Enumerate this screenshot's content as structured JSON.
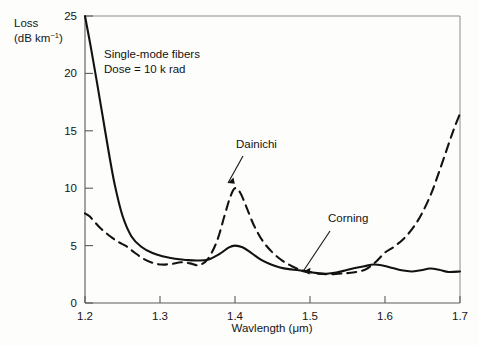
{
  "figure": {
    "background_color": "#fdfdfb",
    "ink_color": "#121212"
  },
  "axes": {
    "y_label_line1": "Loss",
    "y_label_line2_prefix": "(dB km",
    "y_label_line2_sup": "−1",
    "y_label_line2_suffix": ")",
    "x_label": "Wavlength (μm)",
    "y_ticks": [
      "0",
      "5",
      "10",
      "15",
      "20",
      "25"
    ],
    "x_ticks": [
      "1.2",
      "1.3",
      "1.4",
      "1.5",
      "1.6",
      "1.7"
    ]
  },
  "annotations": {
    "note_line1": "Single-mode fibers",
    "note_line2": "Dose = 10 k rad",
    "dainichi_label": "Dainichi",
    "corning_label": "Corning"
  },
  "chart_data": {
    "type": "line",
    "title": "",
    "subtitle": "Single-mode fibers, Dose = 10 k rad",
    "xlabel": "Wavlength (μm)",
    "ylabel": "Loss (dB km−1)",
    "xlim": [
      1.2,
      1.7
    ],
    "ylim": [
      0,
      25
    ],
    "xticks": [
      1.2,
      1.3,
      1.4,
      1.5,
      1.6,
      1.7
    ],
    "yticks": [
      0,
      5,
      10,
      15,
      20,
      25
    ],
    "grid": false,
    "legend": "inline-annotations",
    "series": [
      {
        "name": "Corning",
        "style": "solid",
        "color": "#121212",
        "x": [
          1.2,
          1.208,
          1.216,
          1.224,
          1.232,
          1.24,
          1.25,
          1.262,
          1.275,
          1.29,
          1.305,
          1.32,
          1.335,
          1.35,
          1.365,
          1.38,
          1.392,
          1.4,
          1.41,
          1.422,
          1.435,
          1.448,
          1.46,
          1.472,
          1.485,
          1.497,
          1.51,
          1.522,
          1.535,
          1.548,
          1.56,
          1.572,
          1.585,
          1.598,
          1.61,
          1.622,
          1.635,
          1.648,
          1.66,
          1.672,
          1.685,
          1.7
        ],
        "y": [
          25.0,
          22.2,
          19.2,
          16.1,
          13.0,
          10.2,
          7.6,
          5.8,
          4.9,
          4.35,
          4.05,
          3.85,
          3.75,
          3.7,
          3.8,
          4.3,
          4.85,
          5.0,
          4.85,
          4.35,
          3.75,
          3.35,
          3.1,
          2.95,
          2.85,
          2.7,
          2.6,
          2.55,
          2.65,
          2.85,
          3.05,
          3.2,
          3.35,
          3.25,
          3.05,
          2.85,
          2.75,
          2.85,
          3.0,
          2.9,
          2.7,
          2.75
        ]
      },
      {
        "name": "Dainichi",
        "style": "dashed",
        "color": "#121212",
        "x": [
          1.2,
          1.206,
          1.213,
          1.22,
          1.228,
          1.236,
          1.245,
          1.255,
          1.266,
          1.278,
          1.29,
          1.302,
          1.315,
          1.328,
          1.34,
          1.352,
          1.364,
          1.376,
          1.386,
          1.394,
          1.4,
          1.407,
          1.415,
          1.425,
          1.437,
          1.45,
          1.463,
          1.476,
          1.489,
          1.5,
          1.512,
          1.525,
          1.538,
          1.55,
          1.562,
          1.575,
          1.588,
          1.6,
          1.612,
          1.625,
          1.638,
          1.65,
          1.662,
          1.672,
          1.682,
          1.691,
          1.7
        ],
        "y": [
          7.8,
          7.55,
          7.05,
          6.55,
          6.1,
          5.7,
          5.3,
          4.95,
          4.4,
          3.85,
          3.5,
          3.35,
          3.4,
          3.55,
          3.45,
          3.3,
          3.85,
          5.4,
          7.6,
          9.3,
          10.0,
          9.6,
          8.4,
          6.8,
          5.4,
          4.4,
          3.7,
          3.2,
          2.85,
          2.7,
          2.55,
          2.5,
          2.55,
          2.6,
          2.7,
          2.95,
          3.6,
          4.4,
          4.9,
          5.6,
          6.6,
          7.9,
          9.6,
          11.4,
          13.3,
          15.0,
          16.5
        ]
      }
    ]
  }
}
